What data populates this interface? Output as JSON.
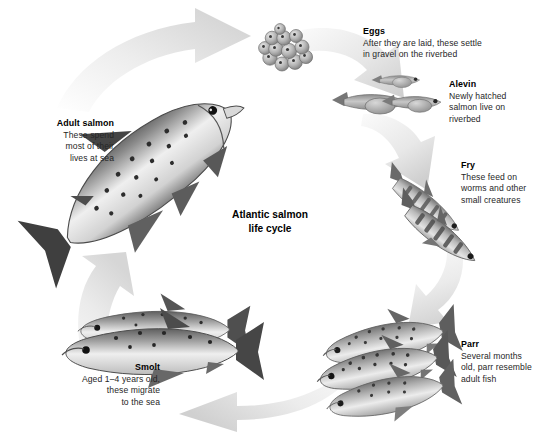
{
  "diagram": {
    "title_line1": "Atlantic salmon",
    "title_line2": "life cycle",
    "background_color": "#ffffff",
    "arrow_color_light": "#f2f2f2",
    "arrow_color_dark": "#c9c9c9",
    "ink_color": "#262626"
  },
  "stages": [
    {
      "id": "eggs",
      "heading": "Eggs",
      "body_lines": [
        "After they are laid, these settle",
        "in gravel on the riverbed"
      ],
      "body": "After they are laid, these settle in gravel on the riverbed",
      "align": "left"
    },
    {
      "id": "alevin",
      "heading": "Alevin",
      "body_lines": [
        "Newly hatched",
        "salmon live on",
        "riverbed"
      ],
      "body": "Newly hatched salmon live on riverbed",
      "align": "left"
    },
    {
      "id": "fry",
      "heading": "Fry",
      "body_lines": [
        "These feed on",
        "worms and other",
        "small creatures"
      ],
      "body": "These feed on worms and other small creatures",
      "align": "left"
    },
    {
      "id": "parr",
      "heading": "Parr",
      "body_lines": [
        "Several months",
        "old, parr resemble",
        "adult fish"
      ],
      "body": "Several months old, parr resemble adult fish",
      "align": "left"
    },
    {
      "id": "smolt",
      "heading": "Smolt",
      "body_lines": [
        "Aged 1–4 years old,",
        "these migrate",
        "to the sea"
      ],
      "body": "Aged 1–4 years old, these migrate to the sea",
      "align": "right"
    },
    {
      "id": "adult-salmon",
      "heading": "Adult salmon",
      "body_lines": [
        "These spend",
        "most of their",
        "lives at sea"
      ],
      "body": "These spend most of their lives at sea",
      "align": "right"
    }
  ],
  "arrows": [
    {
      "id": "arrow-adult-to-eggs",
      "direction": "up-right"
    },
    {
      "id": "arrow-eggs-to-alevin",
      "direction": "down-right"
    },
    {
      "id": "arrow-alevin-to-fry",
      "direction": "down"
    },
    {
      "id": "arrow-fry-to-parr",
      "direction": "down"
    },
    {
      "id": "arrow-parr-to-smolt",
      "direction": "left"
    },
    {
      "id": "arrow-smolt-to-adult",
      "direction": "up"
    }
  ]
}
